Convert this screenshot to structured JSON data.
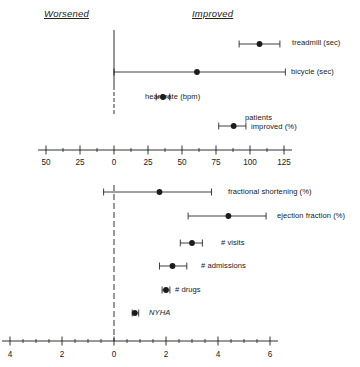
{
  "headers": {
    "left": "Worsened",
    "right": "Improved"
  },
  "chart_data": {
    "type": "scatter",
    "title": "",
    "subtitle": "",
    "xlabel": "",
    "ylabel": "",
    "grid": false,
    "legend": "none",
    "annotations": [
      "Worsened",
      "Improved"
    ],
    "panels": [
      {
        "name": "top-panel",
        "axis": {
          "xlim": [
            -62,
            138
          ],
          "zero_line": 0,
          "major_ticks": [
            -50,
            -25,
            0,
            25,
            50,
            75,
            100,
            125
          ],
          "tick_labels": [
            "50",
            "25",
            "0",
            "25",
            "50",
            "75",
            "100",
            "125"
          ],
          "minor_tick_step": 12.5
        },
        "rows": [
          {
            "label": "treadmill (sec)",
            "estimate": 107,
            "ci_low": 92,
            "ci_high": 122
          },
          {
            "label": "bicycle (sec)",
            "estimate": 61,
            "ci_low": 0,
            "ci_high": 126
          },
          {
            "label": "heart rate (bpm)",
            "estimate": 36,
            "ci_low": 31,
            "ci_high": 41
          },
          {
            "label": "patients\nimproved (%)",
            "label_line1": "patients",
            "label_line2": "improved (%)",
            "estimate": 88,
            "ci_low": 77,
            "ci_high": 97
          }
        ]
      },
      {
        "name": "bottom-panel",
        "axis": {
          "xlim": [
            -4.4,
            6.6
          ],
          "zero_line": 0,
          "major_ticks": [
            -4,
            -2,
            0,
            2,
            4,
            6
          ],
          "tick_labels": [
            "4",
            "2",
            "0",
            "2",
            "4",
            "6"
          ],
          "minor_tick_step": 0.5
        },
        "rows": [
          {
            "label": "fractional shortening (%)",
            "estimate": 1.75,
            "ci_low": -0.4,
            "ci_high": 3.75
          },
          {
            "label": "ejection fraction (%)",
            "estimate": 4.4,
            "ci_low": 2.85,
            "ci_high": 5.85
          },
          {
            "label": "# visits",
            "estimate": 3.0,
            "ci_low": 2.55,
            "ci_high": 3.4
          },
          {
            "label": "# admissions",
            "estimate": 2.25,
            "ci_low": 1.75,
            "ci_high": 2.8
          },
          {
            "label": "# drugs",
            "estimate": 2.0,
            "ci_low": 1.85,
            "ci_high": 2.15
          },
          {
            "label": "NYHA",
            "estimate": 0.8,
            "ci_low": 0.7,
            "ci_high": 0.95,
            "italic": true
          }
        ]
      }
    ]
  }
}
